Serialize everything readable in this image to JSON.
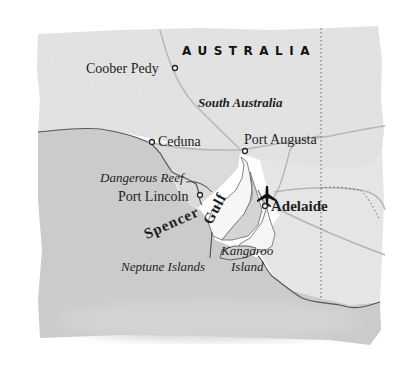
{
  "map": {
    "country_label": "AUSTRALIA",
    "state_label": "South Australia",
    "cities": [
      {
        "name": "Coober Pedy"
      },
      {
        "name": "Ceduna"
      },
      {
        "name": "Port Augusta"
      },
      {
        "name": "Port Lincoln"
      },
      {
        "name": "Adelaide",
        "capital": true
      }
    ],
    "features": [
      {
        "name": "Dangerous Reef"
      },
      {
        "name": "Neptune Islands"
      },
      {
        "name": "Kangaroo Island",
        "lines": [
          "Kangaroo",
          "Island"
        ]
      }
    ],
    "water_label": {
      "word1": "Spencer",
      "word2": "Gulf"
    },
    "icons": {
      "airport": "airplane-icon",
      "city_marker": "circle-icon"
    },
    "colors": {
      "land": "#e4e4e4",
      "sea": "#c9c9c9",
      "gulf_water": "#f7f7f7",
      "coast": "#555555",
      "road": "#b8b8b8",
      "border": "#666666",
      "text": "#1e1e1e"
    }
  }
}
